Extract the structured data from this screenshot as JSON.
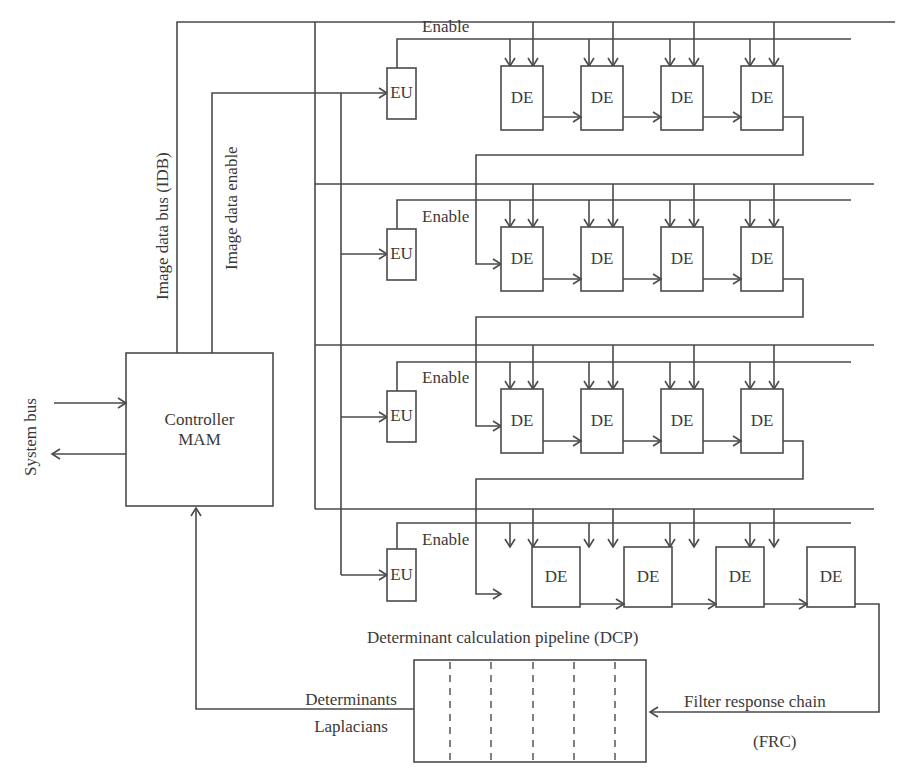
{
  "diagram": {
    "controller": {
      "line1": "Controller",
      "line2": "MAM"
    },
    "system_bus": "System bus",
    "image_data_bus": "Image data bus (IDB)",
    "image_data_enable": "Image data enable",
    "eu_label": "EU",
    "de_label": "DE",
    "enable_label": "Enable",
    "rows": [
      {
        "eu": "EU",
        "enable": "Enable",
        "des": [
          "DE",
          "DE",
          "DE",
          "DE"
        ]
      },
      {
        "eu": "EU",
        "enable": "Enable",
        "des": [
          "DE",
          "DE",
          "DE",
          "DE"
        ]
      },
      {
        "eu": "EU",
        "enable": "Enable",
        "des": [
          "DE",
          "DE",
          "DE",
          "DE"
        ]
      },
      {
        "eu": "EU",
        "enable": "Enable",
        "des": [
          "DE",
          "DE",
          "DE",
          "DE"
        ]
      }
    ],
    "pipeline_title": "Determinant calculation pipeline (DCP)",
    "pipeline_stages": 6,
    "determinants": "Determinants",
    "laplacians": "Laplacians",
    "filter_response_chain": "Filter response chain",
    "frc": "(FRC)",
    "line_color": "#4a4a4a",
    "background": "#ffffff"
  }
}
